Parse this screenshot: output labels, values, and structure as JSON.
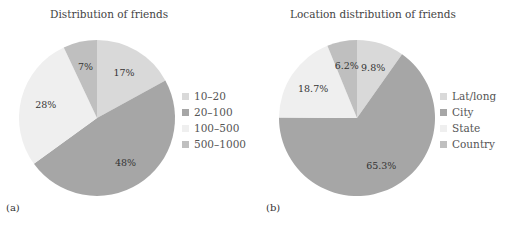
{
  "chart_data": [
    {
      "type": "pie",
      "title": "Distribution of friends",
      "panel_label": "(a)",
      "categories": [
        "10–20",
        "20–100",
        "100–500",
        "500–1000"
      ],
      "values": [
        17,
        48,
        28,
        7
      ],
      "value_labels": [
        "17%",
        "48%",
        "28%",
        "7%"
      ],
      "colors": [
        "#d9d9d9",
        "#a6a6a6",
        "#efefef",
        "#bfbfbf"
      ],
      "legend_position": "right"
    },
    {
      "type": "pie",
      "title": "Location distribution of friends",
      "panel_label": "(b)",
      "categories": [
        "Lat/long",
        "City",
        "State",
        "Country"
      ],
      "values": [
        9.8,
        65.3,
        18.7,
        6.2
      ],
      "value_labels": [
        "9.8%",
        "65.3%",
        "18.7%",
        "6.2%"
      ],
      "colors": [
        "#d9d9d9",
        "#a6a6a6",
        "#efefef",
        "#bfbfbf"
      ],
      "legend_position": "right"
    }
  ]
}
